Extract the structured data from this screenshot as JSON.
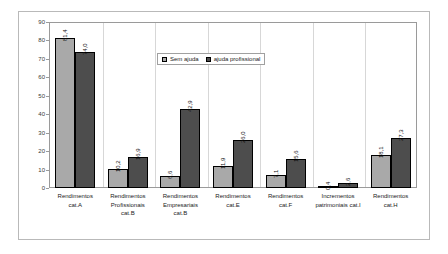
{
  "chart_data": {
    "type": "bar",
    "title": "",
    "xlabel": "",
    "ylabel": "",
    "ylim": [
      0,
      90
    ],
    "ytick_step": 10,
    "yticks": [
      "0",
      "10",
      "20",
      "30",
      "40",
      "50",
      "60",
      "70",
      "80",
      "90"
    ],
    "grid": "vertical-category-separators-only",
    "legend_position": "top-center-inside",
    "categories": [
      "Rendimentos cat.A",
      "Rendimentos Profissionais cat.B",
      "Rendimentos Empresariais cat.B",
      "Rendimentos cat.E",
      "Rendimentos cat.F",
      "Incrementos patrimoniais cat.I",
      "Rendimentos cat.H"
    ],
    "category_lines": [
      [
        "Rendimentos",
        "cat.A"
      ],
      [
        "Rendimentos",
        "Profissionais",
        "cat.B"
      ],
      [
        "Rendimentos",
        "Empresariais",
        "cat.B"
      ],
      [
        "Rendimentos",
        "cat.E"
      ],
      [
        "Rendimentos",
        "cat.F"
      ],
      [
        "Incrementos",
        "patrimoniais cat.I"
      ],
      [
        "Rendimentos",
        "cat.H"
      ]
    ],
    "series": [
      {
        "name": "Sem ajuda",
        "color": "#a9a9a9",
        "values": [
          81.4,
          10.2,
          6.6,
          11.9,
          7.1,
          0.4,
          18.1
        ],
        "labels": [
          "81,4",
          "10,2",
          "6,6",
          "11,9",
          "7,1",
          "0,4",
          "18,1"
        ]
      },
      {
        "name": "ajuda profissional",
        "color": "#4d4d4d",
        "values": [
          74.0,
          16.9,
          42.9,
          26.0,
          15.6,
          2.6,
          27.3
        ],
        "labels": [
          "74,0",
          "16,9",
          "42,9",
          "26,0",
          "15,6",
          "2,6",
          "27,3"
        ]
      }
    ]
  },
  "legend": {
    "items": [
      {
        "label": "Sem ajuda",
        "swatch": "light"
      },
      {
        "label": "ajuda profissional",
        "swatch": "dark"
      }
    ]
  },
  "colors": {
    "series_light": "#a9a9a9",
    "series_dark": "#4d4d4d",
    "plot_border": "#9a9a9a",
    "frame_border": "#b9b9b9",
    "gridline": "#d7d7d7",
    "background": "#ffffff"
  }
}
